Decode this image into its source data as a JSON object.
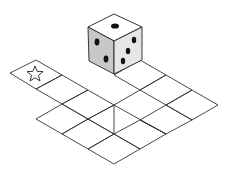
{
  "diagram": {
    "start_marker": "star-icon",
    "die": {
      "top_face_pips": 1,
      "left_face_pips": 3,
      "right_face_pips": 4
    },
    "colors": {
      "line": "#333333",
      "die_top": "#ffffff",
      "die_left": "#c8c8c8",
      "die_right": "#e6e6e6",
      "pip": "#111111"
    }
  }
}
